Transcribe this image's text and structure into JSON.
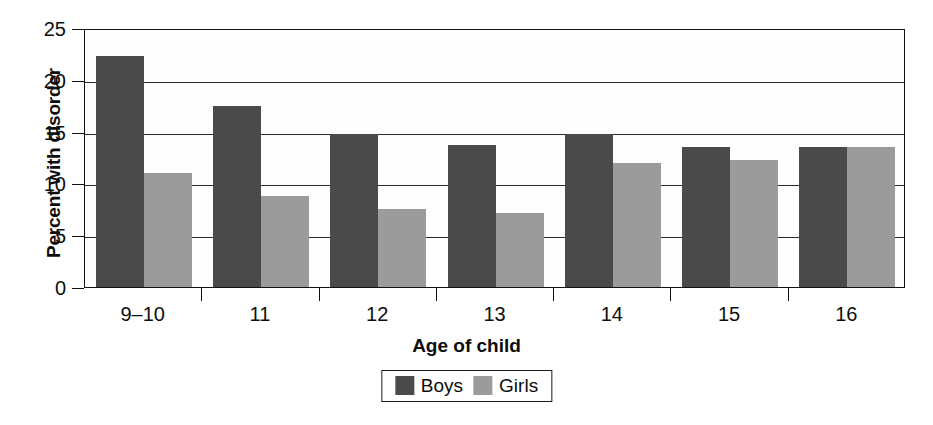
{
  "chart_data": {
    "type": "bar",
    "title": "",
    "xlabel": "Age of child",
    "ylabel": "Percent with disorder",
    "categories": [
      "9–10",
      "11",
      "12",
      "13",
      "14",
      "15",
      "16"
    ],
    "series": [
      {
        "name": "Boys",
        "color": "#4a4a4a",
        "values": [
          22.3,
          17.5,
          14.8,
          13.7,
          14.8,
          13.5,
          13.5
        ]
      },
      {
        "name": "Girls",
        "color": "#9b9b9b",
        "values": [
          11.0,
          8.8,
          7.5,
          7.1,
          12.0,
          12.3,
          13.5
        ]
      }
    ],
    "ylim": [
      0,
      25
    ],
    "ytick_labels": [
      "0",
      "5",
      "10",
      "15",
      "20",
      "25"
    ],
    "ytick_values": [
      0,
      5,
      10,
      15,
      20,
      25
    ],
    "grid": "horizontal",
    "legend_position": "bottom-center"
  }
}
